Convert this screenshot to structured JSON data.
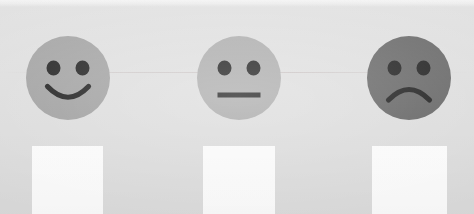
{
  "sheet": {
    "background_color": "#dedede",
    "top_band_color": "#f1f1f1",
    "width": 474,
    "height": 214
  },
  "scale": {
    "title": "",
    "instruction": "",
    "options": [
      {
        "id": "happy",
        "sentiment": "positive",
        "icon": "smiley-happy-face-icon",
        "label": "",
        "face_color": "#9d9d9d",
        "feature_color": "#111111",
        "mouth": "smile",
        "checkbox_label": "",
        "checkbox_color": "#ffffff",
        "checked": false
      },
      {
        "id": "neutral",
        "sentiment": "neutral",
        "icon": "smiley-neutral-face-icon",
        "label": "",
        "face_color": "#a8a8a8",
        "feature_color": "#111111",
        "mouth": "flat",
        "checkbox_label": "",
        "checkbox_color": "#ffffff",
        "checked": false
      },
      {
        "id": "sad",
        "sentiment": "negative",
        "icon": "smiley-sad-face-icon",
        "label": "",
        "face_color": "#5e5e5e",
        "feature_color": "#111111",
        "mouth": "frown",
        "checkbox_label": "",
        "checkbox_color": "#ffffff",
        "checked": false
      }
    ]
  }
}
